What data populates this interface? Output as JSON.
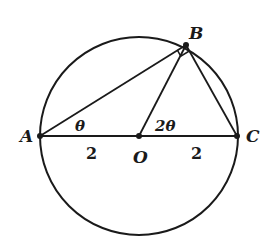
{
  "diagram": {
    "type": "geometry",
    "circle": {
      "center": "O",
      "cx": 139,
      "cy": 136,
      "r": 99
    },
    "points": [
      {
        "name": "A",
        "x": 40,
        "y": 136,
        "label": "A"
      },
      {
        "name": "B",
        "x": 186,
        "y": 45,
        "label": "B"
      },
      {
        "name": "C",
        "x": 237,
        "y": 136,
        "label": "C"
      },
      {
        "name": "O",
        "x": 139,
        "y": 136,
        "label": "O"
      }
    ],
    "segments": [
      "AB",
      "BC",
      "AC",
      "OB"
    ],
    "angles": [
      {
        "at": "A",
        "label": "θ"
      },
      {
        "at": "O",
        "label": "2θ"
      },
      {
        "at": "B",
        "label": "right-angle",
        "marker": "square"
      }
    ],
    "lengths": [
      {
        "segment": "AO",
        "label": "2"
      },
      {
        "segment": "OC",
        "label": "2"
      }
    ],
    "colors": {
      "stroke": "#1a1a1a",
      "background": "#ffffff"
    }
  }
}
